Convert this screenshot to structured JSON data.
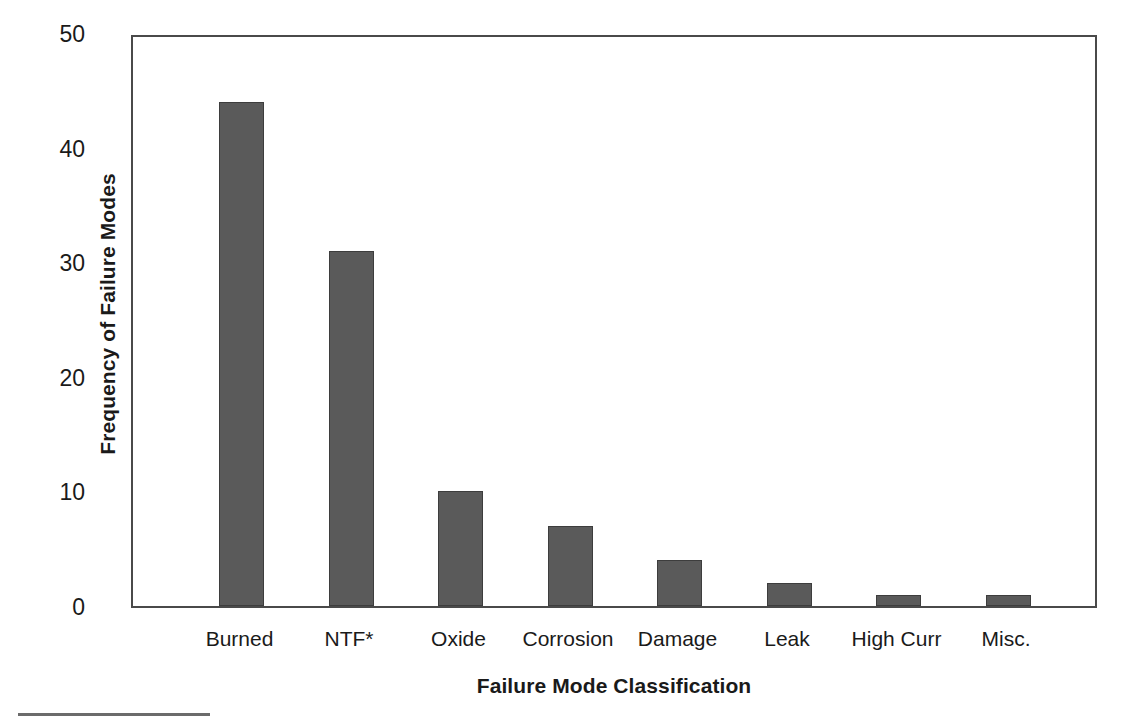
{
  "chart_data": {
    "type": "bar",
    "title": "",
    "xlabel": "Failure Mode Classification",
    "ylabel": "Frequency of Failure Modes",
    "categories": [
      "Burned",
      "NTF*",
      "Oxide",
      "Corrosion",
      "Damage",
      "Leak",
      "High Curr",
      "Misc."
    ],
    "values": [
      44,
      31,
      10,
      7,
      4,
      2,
      1,
      1
    ],
    "ylim": [
      0,
      50
    ],
    "yticks": [
      0,
      10,
      20,
      30,
      40,
      50
    ],
    "ytick_labels": [
      "0",
      "10",
      "20",
      "30",
      "40",
      "50"
    ],
    "grid": false,
    "legend": null,
    "bar_color": "#5a5a5a",
    "axis_color": "#4a4a4a",
    "background_color": "#ffffff"
  },
  "axes": {
    "y_title": "Frequency of Failure Modes",
    "x_title": "Failure Mode Classification"
  },
  "footnote": {
    "rule": ""
  }
}
